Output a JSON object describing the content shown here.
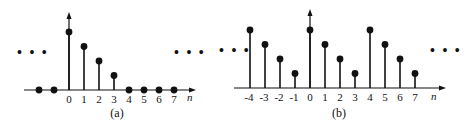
{
  "chart_data": [
    {
      "type": "stem",
      "caption": "(a)",
      "xlabel": "n",
      "ylabel": "",
      "x": [
        -2,
        -1,
        0,
        1,
        2,
        3,
        4,
        5,
        6,
        7
      ],
      "values": [
        0,
        0,
        4,
        3,
        2,
        1,
        0,
        0,
        0,
        0
      ],
      "tick_labels": [
        "0",
        "1",
        "2",
        "3",
        "4",
        "5",
        "6",
        "7"
      ],
      "continuation_left": "...",
      "continuation_right": "...",
      "grid": false,
      "description": "Finite-length sequence: nonzero only for n=0..3 (4,3,2,1), zero elsewhere"
    },
    {
      "type": "stem",
      "caption": "(b)",
      "xlabel": "n",
      "ylabel": "",
      "x": [
        -4,
        -3,
        -2,
        -1,
        0,
        1,
        2,
        3,
        4,
        5,
        6,
        7
      ],
      "values": [
        4,
        3,
        2,
        1,
        4,
        3,
        2,
        1,
        4,
        3,
        2,
        1
      ],
      "tick_labels": [
        "-4",
        "-3",
        "-2",
        "-1",
        "0",
        "1",
        "2",
        "3",
        "4",
        "5",
        "6",
        "7"
      ],
      "continuation_left": "...",
      "continuation_right": "...",
      "grid": false,
      "description": "Periodic extension with period 4 of the sequence in (a)"
    }
  ],
  "labels": {
    "a_caption": "(a)",
    "b_caption": "(b)",
    "n_label": "n",
    "ellipsis": "• • •"
  },
  "colors": {
    "ink": "#111111",
    "background": "#ffffff"
  }
}
